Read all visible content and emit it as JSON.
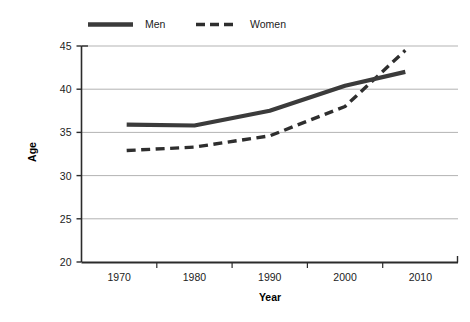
{
  "chart_data": {
    "type": "line",
    "title": "",
    "xlabel": "Year",
    "ylabel": "Age",
    "xlim": [
      1965,
      2015
    ],
    "ylim": [
      20,
      45
    ],
    "ytick_values": [
      20,
      25,
      30,
      35,
      40,
      45
    ],
    "ytick_labels": [
      "20",
      "25",
      "30",
      "35",
      "40",
      "45"
    ],
    "xtick_labels": [
      "1970",
      "1980",
      "1990",
      "2000",
      "2010"
    ],
    "xtick_values": [
      1970,
      1980,
      1990,
      2000,
      2010
    ],
    "grid": "horizontal",
    "legend_position": "top-center",
    "x": [
      1971,
      1980,
      1990,
      2000,
      2008
    ],
    "series": [
      {
        "name": "Men",
        "style": "solid",
        "color": "#3b3b3b",
        "width": 4.2,
        "values": [
          35.9,
          35.8,
          37.5,
          40.4,
          42.0
        ]
      },
      {
        "name": "Women",
        "style": "dashed",
        "color": "#2e2e2e",
        "width": 3.4,
        "values": [
          32.9,
          33.3,
          34.6,
          38.0,
          44.5
        ]
      }
    ]
  },
  "legend": {
    "entries": [
      {
        "label": "Men",
        "swatch": "solid-line-swatch"
      },
      {
        "label": "Women",
        "swatch": "dashed-line-swatch"
      }
    ]
  },
  "axes": {
    "y_title": "Age",
    "x_title": "Year",
    "y_labels": [
      "45",
      "40",
      "35",
      "30",
      "25",
      "20"
    ],
    "x_labels": [
      "1970",
      "1980",
      "1990",
      "2000",
      "2010"
    ]
  },
  "colors": {
    "series_men": "#3b3b3b",
    "series_women": "#2e2e2e",
    "gridline": "#b3b3b3",
    "axis": "#2b2b2b",
    "background": "#ffffff",
    "text": "#1c1c1c"
  }
}
